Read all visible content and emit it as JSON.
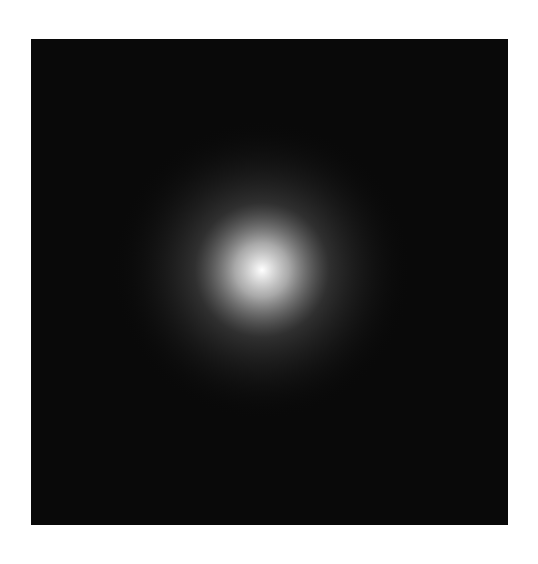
{
  "figure": {
    "width": 538,
    "height": 564,
    "background_color": "#ffffff",
    "title": "",
    "has_title": false,
    "has_axes": false,
    "has_ticks": false,
    "has_legend": false,
    "has_colorbar": false,
    "has_axis_labels": false
  },
  "plot_panel": {
    "left": 31,
    "top": 39,
    "width": 477,
    "height": 486,
    "background_color": "#090909",
    "border": "none"
  },
  "chart_data": {
    "type": "heatmap",
    "title": "",
    "xlabel": "",
    "ylabel": "",
    "subtitle": "",
    "annotations": [],
    "legend_entries": [],
    "legend_position": "none",
    "grid": false,
    "xlim": [
      -1,
      1
    ],
    "ylim": [
      -1,
      1
    ],
    "xticks": [],
    "yticks": [],
    "xticklabels": [],
    "yticklabels": [],
    "colormap": "gray",
    "value_range": [
      0,
      1
    ],
    "background_value": 0.035,
    "render": {
      "center_x_px": 231,
      "center_y_px": 231,
      "core_radius_px": 7,
      "core_glow_radius_px": 60,
      "arm_count": 12,
      "spiral_tightness_b": 0.33,
      "arm_angular_width_deg": 13,
      "arm_falloff_power": 1.05,
      "noise_amplitude": 0.045,
      "global_gain": 1.0,
      "max_radius_px": 430,
      "arm_phase_offset_deg": -18
    },
    "arms": [
      {
        "index": 0,
        "start_angle_deg": 0,
        "amplitude": 0.92,
        "width_deg": 12
      },
      {
        "index": 1,
        "start_angle_deg": 30,
        "amplitude": 0.8,
        "width_deg": 13
      },
      {
        "index": 2,
        "start_angle_deg": 60,
        "amplitude": 0.62,
        "width_deg": 13
      },
      {
        "index": 3,
        "start_angle_deg": 90,
        "amplitude": 0.48,
        "width_deg": 14
      },
      {
        "index": 4,
        "start_angle_deg": 120,
        "amplitude": 0.34,
        "width_deg": 14
      },
      {
        "index": 5,
        "start_angle_deg": 150,
        "amplitude": 0.26,
        "width_deg": 15
      },
      {
        "index": 6,
        "start_angle_deg": 180,
        "amplitude": 0.24,
        "width_deg": 15
      },
      {
        "index": 7,
        "start_angle_deg": 210,
        "amplitude": 0.3,
        "width_deg": 14
      },
      {
        "index": 8,
        "start_angle_deg": 240,
        "amplitude": 0.46,
        "width_deg": 14
      },
      {
        "index": 9,
        "start_angle_deg": 270,
        "amplitude": 0.64,
        "width_deg": 13
      },
      {
        "index": 10,
        "start_angle_deg": 300,
        "amplitude": 0.86,
        "width_deg": 12
      },
      {
        "index": 11,
        "start_angle_deg": 330,
        "amplitude": 1.0,
        "width_deg": 12
      }
    ],
    "brightness_profile": {
      "center_peak": 1.0,
      "at_radius_50px": 0.55,
      "at_radius_120px": 0.3,
      "at_radius_200px": 0.15,
      "at_radius_300px": 0.06,
      "at_radius_430px": 0.03
    },
    "bright_lobe_direction_deg": -25,
    "faint_lobe_direction_deg": 165
  },
  "colors": {
    "page_background": "#ffffff",
    "panel_background": "#090909",
    "core_highlight": "#ffffff",
    "arm_bright": "#e8e8e8",
    "arm_mid": "#8a8a8a",
    "arm_dim": "#3a3a3a",
    "shadow": "#050505"
  }
}
